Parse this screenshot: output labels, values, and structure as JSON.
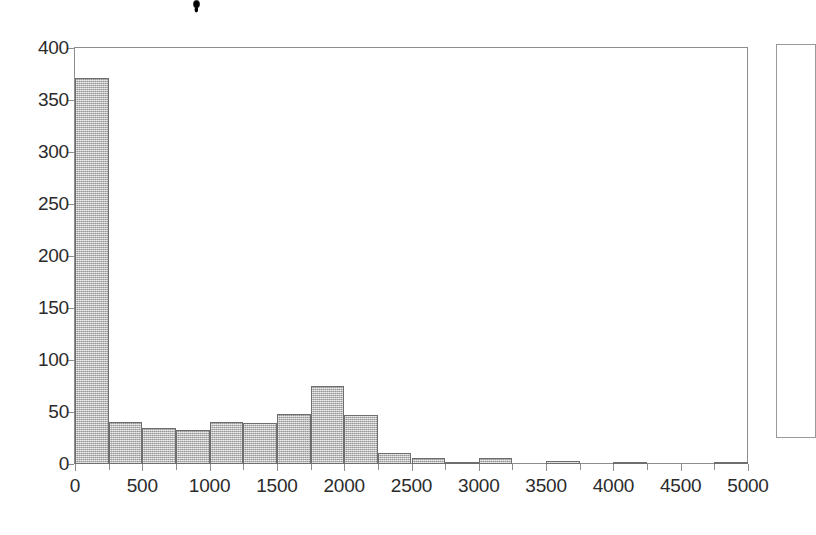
{
  "figure": {
    "background_color": "#ffffff",
    "axis_color": "#8d8d8d",
    "bar_fill_color": "#b4b4b4",
    "bar_edge_color": "#6e6e6e",
    "artifact_label": "scan-speck"
  },
  "legend": {
    "present": true,
    "entries": [],
    "note": ""
  },
  "chart_data": {
    "type": "bar",
    "title": "",
    "subtitle": "",
    "xlabel": "",
    "ylabel": "",
    "grid": false,
    "legend_position": "right",
    "xlim": [
      0,
      5000
    ],
    "ylim": [
      0,
      400
    ],
    "xticks": [
      0,
      500,
      1000,
      1500,
      2000,
      2500,
      3000,
      3500,
      4000,
      4500,
      5000
    ],
    "xtick_labels": [
      "0",
      "500",
      "1000",
      "1500",
      "2000",
      "2500",
      "3000",
      "3500",
      "4000",
      "4500",
      "5000"
    ],
    "yticks": [
      0,
      50,
      100,
      150,
      200,
      250,
      300,
      350,
      400
    ],
    "ytick_labels": [
      "0",
      "50",
      "100",
      "150",
      "200",
      "250",
      "300",
      "350",
      "400"
    ],
    "bin_width": 250,
    "bin_starts": [
      0,
      250,
      500,
      750,
      1000,
      1250,
      1500,
      1750,
      2000,
      2250,
      2500,
      2750,
      3000,
      3250,
      3500,
      3750,
      4000,
      4250,
      4500,
      4750
    ],
    "categories": [
      "0-250",
      "250-500",
      "500-750",
      "750-1000",
      "1000-1250",
      "1250-1500",
      "1500-1750",
      "1750-2000",
      "2000-2250",
      "2250-2500",
      "2500-2750",
      "2750-3000",
      "3000-3250",
      "3250-3500",
      "3500-3750",
      "3750-4000",
      "4000-4250",
      "4250-4500",
      "4500-4750",
      "4750-5000"
    ],
    "values": [
      371,
      40,
      35,
      33,
      40,
      39,
      48,
      75,
      47,
      11,
      6,
      1,
      6,
      0,
      3,
      0,
      1,
      0,
      0,
      1
    ]
  }
}
